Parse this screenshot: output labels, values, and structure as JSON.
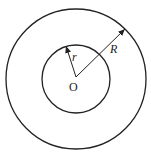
{
  "diagram": {
    "type": "concentric-circles",
    "center_label": "O",
    "inner_radius_label": "r",
    "outer_radius_label": "R",
    "stroke_color": "#222222",
    "background": "#ffffff"
  }
}
